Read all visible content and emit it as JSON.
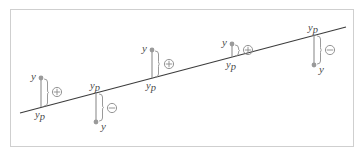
{
  "figure": {
    "title": "",
    "background_color": "#ffffff",
    "border_color": "#cfcfcf",
    "line_color": "#3c3c3c",
    "stem_color": "#8e8e8e",
    "marker_color": "#9a9a9a",
    "label_color": "#4a4a4a"
  },
  "labels": {
    "observed": "y",
    "predicted_main": "y",
    "predicted_sub": "p",
    "sign_positive": "plus-circle-icon",
    "sign_negative": "minus-circle-icon"
  },
  "chart_data": {
    "type": "scatter",
    "title": "",
    "xlabel": "",
    "ylabel": "",
    "grid": false,
    "legend": null,
    "xlim": [
      0,
      364
    ],
    "ylim": [
      0,
      157
    ],
    "regression_line": {
      "x_start": 20,
      "y_start": 113,
      "x_end": 346,
      "y_end": 27,
      "label": ""
    },
    "points": [
      {
        "index": 1,
        "x": 41,
        "y_observed": 78,
        "y_predicted": 107,
        "residual_sign": "+",
        "sign_symbol": "⊕",
        "observed_label": "y",
        "predicted_label": "y_p",
        "observed_label_side": "left",
        "predicted_label_side": "below",
        "sign_x": 57,
        "sign_y": 92
      },
      {
        "index": 2,
        "x": 96,
        "y_observed": 122,
        "y_predicted": 93,
        "residual_sign": "-",
        "sign_symbol": "⊖",
        "observed_label": "y",
        "predicted_label": "y_p",
        "observed_label_side": "below-right",
        "predicted_label_side": "above",
        "sign_x": 112,
        "sign_y": 108
      },
      {
        "index": 3,
        "x": 152,
        "y_observed": 50,
        "y_predicted": 78,
        "residual_sign": "+",
        "sign_symbol": "⊕",
        "observed_label": "y",
        "predicted_label": "y_p",
        "observed_label_side": "left",
        "predicted_label_side": "below",
        "sign_x": 169,
        "sign_y": 64
      },
      {
        "index": 4,
        "x": 232,
        "y_observed": 44,
        "y_predicted": 57,
        "residual_sign": "+",
        "sign_symbol": "⊕",
        "observed_label": "y",
        "predicted_label": "y_p",
        "observed_label_side": "left",
        "predicted_label_side": "below",
        "sign_x": 248,
        "sign_y": 50
      },
      {
        "index": 5,
        "x": 314,
        "y_observed": 65,
        "y_predicted": 35,
        "residual_sign": "-",
        "sign_symbol": "⊖",
        "observed_label": "y",
        "predicted_label": "y_p",
        "observed_label_side": "below-right",
        "predicted_label_side": "above",
        "sign_x": 330,
        "sign_y": 50
      }
    ]
  }
}
